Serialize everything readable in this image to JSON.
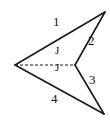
{
  "figure": {
    "type": "geometry-diagram",
    "shape_name": "concave-dart-quadrilateral",
    "background_color": "#ffffff",
    "stroke_color": "#1a1a1a",
    "dashed_stroke_color": "#1a1a1a",
    "label_color": "#111111",
    "outline": {
      "vertices": [
        {
          "name": "left-vertex",
          "x": 15,
          "y": 65
        },
        {
          "name": "top-right-vertex",
          "x": 105,
          "y": 12
        },
        {
          "name": "center-notch-vertex",
          "x": 75,
          "y": 65
        },
        {
          "name": "bottom-right-vertex",
          "x": 104,
          "y": 114
        }
      ],
      "edges": [
        {
          "name": "edge-1",
          "from": "left-vertex",
          "to": "top-right-vertex"
        },
        {
          "name": "edge-2",
          "from": "top-right-vertex",
          "to": "center-notch-vertex"
        },
        {
          "name": "edge-3",
          "from": "center-notch-vertex",
          "to": "bottom-right-vertex"
        },
        {
          "name": "edge-4",
          "from": "bottom-right-vertex",
          "to": "left-vertex"
        }
      ]
    },
    "dashed_segment": {
      "name": "diagonal-dashed-line",
      "from": {
        "x": 15,
        "y": 65
      },
      "to": {
        "x": 75,
        "y": 65
      },
      "dash_pattern": "3,2"
    },
    "labels": {
      "angle_1": "1",
      "angle_2": "2",
      "angle_3": "3",
      "angle_4": "4",
      "mid_upper": "J",
      "mid_lower": "J"
    },
    "label_positions": {
      "angle_1": {
        "x": 53,
        "y": 22
      },
      "angle_2": {
        "x": 88,
        "y": 40
      },
      "angle_3": {
        "x": 89,
        "y": 79
      },
      "angle_4": {
        "x": 51,
        "y": 98
      },
      "mid_upper": {
        "x": 55,
        "y": 48
      },
      "mid_lower": {
        "x": 55,
        "y": 64
      }
    }
  }
}
